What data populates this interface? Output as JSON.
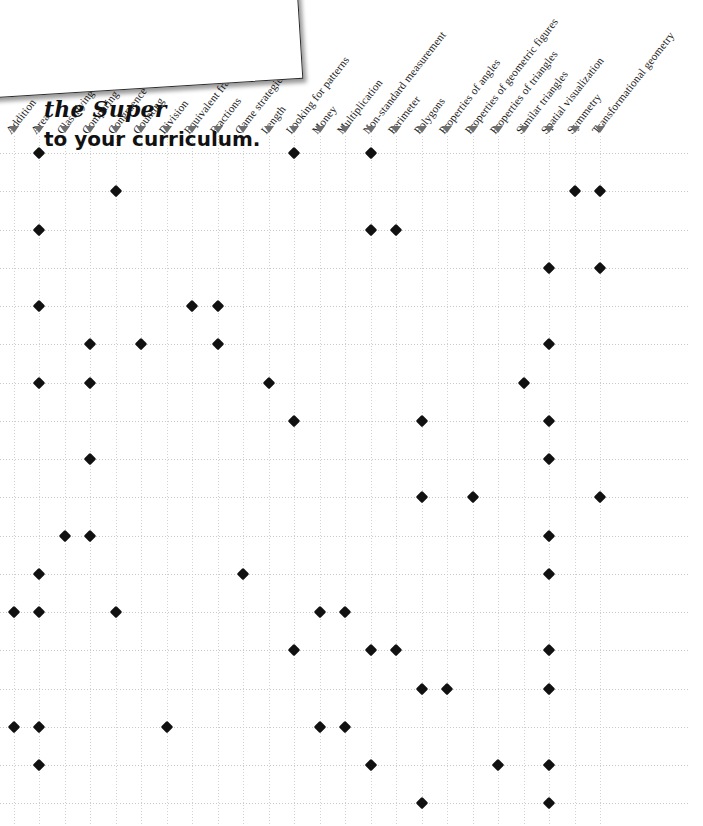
{
  "promo": {
    "line1": "the Super",
    "line2": "to your curriculum."
  },
  "grid": {
    "marker_icon": "triangle-down-icon",
    "dot_icon": "diamond-marker-icon",
    "accent_color": "#111111",
    "gridline_color": "#d2d2d2",
    "marker_color": "#6f6f6f"
  },
  "columns": [
    "Addition",
    "Area",
    "Classifying",
    "Comparing",
    "Congruence",
    "Counting",
    "Division",
    "Equivalent fractions",
    "Fractions",
    "Game strategies",
    "Length",
    "Looking for patterns",
    "Money",
    "Multiplication",
    "Non-standard measurement",
    "Perimeter",
    "Polygons",
    "Properties of angles",
    "Properties of geometric figures",
    "Properties of triangles",
    "Similar triangles",
    "Spatial visualization",
    "Symmetry",
    "Transformational geometry"
  ],
  "chart_data": {
    "type": "scatter",
    "title": "",
    "xlabel": "",
    "ylabel": "",
    "grid": true,
    "legend": "none",
    "categories": [
      "Addition",
      "Area",
      "Classifying",
      "Comparing",
      "Congruence",
      "Counting",
      "Division",
      "Equivalent fractions",
      "Fractions",
      "Game strategies",
      "Length",
      "Looking for patterns",
      "Money",
      "Multiplication",
      "Non-standard measurement",
      "Perimeter",
      "Polygons",
      "Properties of angles",
      "Properties of geometric figures",
      "Properties of triangles",
      "Similar triangles",
      "Spatial visualization",
      "Symmetry",
      "Transformational geometry"
    ],
    "row_count": 18,
    "rows": [
      {
        "index": 0,
        "cols": [
          1,
          11,
          14
        ]
      },
      {
        "index": 1,
        "cols": [
          4,
          22,
          23
        ]
      },
      {
        "index": 2,
        "cols": [
          1,
          14,
          15
        ]
      },
      {
        "index": 3,
        "cols": [
          21,
          23
        ]
      },
      {
        "index": 4,
        "cols": [
          1,
          7,
          8
        ]
      },
      {
        "index": 5,
        "cols": [
          3,
          5,
          8,
          21
        ]
      },
      {
        "index": 6,
        "cols": [
          1,
          3,
          10,
          20
        ]
      },
      {
        "index": 7,
        "cols": [
          11,
          16,
          21
        ]
      },
      {
        "index": 8,
        "cols": [
          3,
          21
        ]
      },
      {
        "index": 9,
        "cols": [
          16,
          18,
          23
        ]
      },
      {
        "index": 10,
        "cols": [
          2,
          3,
          21
        ]
      },
      {
        "index": 11,
        "cols": [
          1,
          9,
          21
        ]
      },
      {
        "index": 12,
        "cols": [
          0,
          1,
          4,
          12,
          13
        ]
      },
      {
        "index": 13,
        "cols": [
          11,
          14,
          15,
          21
        ]
      },
      {
        "index": 14,
        "cols": [
          16,
          17,
          21
        ]
      },
      {
        "index": 15,
        "cols": [
          0,
          1,
          6,
          12,
          13
        ]
      },
      {
        "index": 16,
        "cols": [
          1,
          14,
          19,
          21
        ]
      },
      {
        "index": 17,
        "cols": [
          16,
          21
        ]
      }
    ]
  }
}
